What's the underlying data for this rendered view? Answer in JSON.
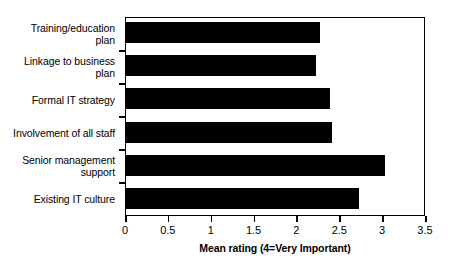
{
  "chart_data": {
    "type": "bar",
    "orientation": "horizontal",
    "title": "",
    "xlabel": "Mean rating (4=Very Important)",
    "ylabel": "",
    "xlim": [
      0,
      3.5
    ],
    "xticks": [
      "0",
      "0.5",
      "1",
      "1.5",
      "2",
      "2.5",
      "3",
      "3.5"
    ],
    "xtick_values": [
      0,
      0.5,
      1,
      1.5,
      2,
      2.5,
      3,
      3.5
    ],
    "grid": false,
    "legend": null,
    "bar_color": "#000000",
    "categories": [
      "Training/education\nplan",
      "Linkage to business\nplan",
      "Formal IT strategy",
      "Involvement of all staff",
      "Senior management\nsupport",
      "Existing IT culture"
    ],
    "values": [
      2.28,
      2.23,
      2.39,
      2.41,
      3.03,
      2.73
    ]
  }
}
